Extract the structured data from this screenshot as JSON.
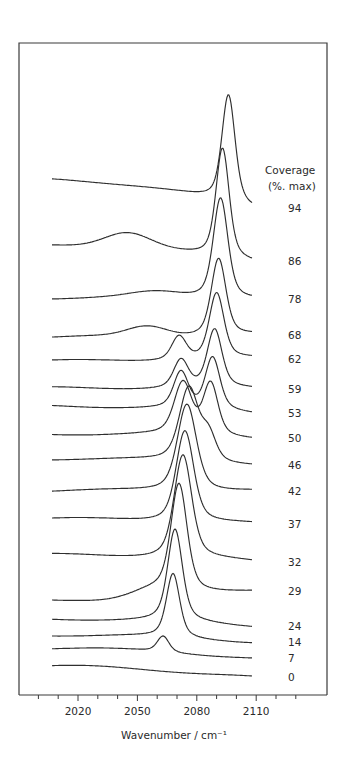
{
  "chart_data": {
    "type": "line",
    "title": "",
    "xlabel": "Wavenumber / cm⁻¹",
    "ylabel": "",
    "xlim": [
      2002,
      2118
    ],
    "x_ticks": [
      2020,
      2050,
      2080,
      2110
    ],
    "x_minor_step": 10,
    "grid": false,
    "legend": {
      "title_line1": "Coverage",
      "title_line2": "(%. max)",
      "position": "right"
    },
    "style": "stacked offset spectra (waterfall), highest coverage at top",
    "series": [
      {
        "name": "94",
        "baseline_y": 179,
        "end_y": 208,
        "peaks": [
          {
            "wn": 2096,
            "height": 108,
            "width": 4.5
          }
        ],
        "hump": null
      },
      {
        "name": "86",
        "baseline_y": 244,
        "end_y": 261,
        "peaks": [
          {
            "wn": 2093,
            "height": 110,
            "width": 4.5
          }
        ],
        "hump": {
          "wn": 2045,
          "height": 14,
          "width": 16
        }
      },
      {
        "name": "78",
        "baseline_y": 298,
        "end_y": 299,
        "peaks": [
          {
            "wn": 2092,
            "height": 102,
            "width": 5
          }
        ],
        "hump": {
          "wn": 2060,
          "height": 6,
          "width": 18
        }
      },
      {
        "name": "68",
        "baseline_y": 337,
        "end_y": 335,
        "peaks": [
          {
            "wn": 2091,
            "height": 78,
            "width": 5
          }
        ],
        "hump": {
          "wn": 2055,
          "height": 10,
          "width": 14
        }
      },
      {
        "name": "62",
        "baseline_y": 361,
        "end_y": 359,
        "peaks": [
          {
            "wn": 2090,
            "height": 66,
            "width": 5
          },
          {
            "wn": 2071,
            "height": 24,
            "width": 5
          }
        ],
        "hump": null
      },
      {
        "name": "59",
        "baseline_y": 388,
        "end_y": 389,
        "peaks": [
          {
            "wn": 2089,
            "height": 58,
            "width": 5
          },
          {
            "wn": 2072,
            "height": 28,
            "width": 5
          }
        ],
        "hump": null
      },
      {
        "name": "53",
        "baseline_y": 406,
        "end_y": 413,
        "peaks": [
          {
            "wn": 2088,
            "height": 52,
            "width": 5
          },
          {
            "wn": 2072,
            "height": 36,
            "width": 5
          }
        ],
        "hump": null
      },
      {
        "name": "50",
        "baseline_y": 434,
        "end_y": 438,
        "peaks": [
          {
            "wn": 2087,
            "height": 52,
            "width": 5
          },
          {
            "wn": 2073,
            "height": 52,
            "width": 6
          }
        ],
        "hump": null
      },
      {
        "name": "46",
        "baseline_y": 459,
        "end_y": 465,
        "peaks": [
          {
            "wn": 2076,
            "height": 74,
            "width": 6.5
          },
          {
            "wn": 2086,
            "height": 26,
            "width": 5
          }
        ],
        "hump": null
      },
      {
        "name": "42",
        "baseline_y": 491,
        "end_y": 491,
        "peaks": [
          {
            "wn": 2075,
            "height": 88,
            "width": 6.5
          }
        ],
        "hump": null
      },
      {
        "name": "37",
        "baseline_y": 519,
        "end_y": 524,
        "peaks": [
          {
            "wn": 2074,
            "height": 92,
            "width": 6
          }
        ],
        "hump": null
      },
      {
        "name": "32",
        "baseline_y": 555,
        "end_y": 562,
        "peaks": [
          {
            "wn": 2073,
            "height": 104,
            "width": 6
          }
        ],
        "hump": null
      },
      {
        "name": "29",
        "baseline_y": 601,
        "end_y": 591,
        "peaks": [
          {
            "wn": 2071,
            "height": 108,
            "width": 5.5
          }
        ],
        "hump": {
          "wn": 2058,
          "height": 8,
          "width": 16
        }
      },
      {
        "name": "24",
        "baseline_y": 619,
        "end_y": 626,
        "peaks": [
          {
            "wn": 2069,
            "height": 92,
            "width": 5
          }
        ],
        "hump": null
      },
      {
        "name": "14",
        "baseline_y": 635,
        "end_y": 642,
        "peaks": [
          {
            "wn": 2068,
            "height": 64,
            "width": 4.5
          }
        ],
        "hump": null
      },
      {
        "name": "7",
        "baseline_y": 648,
        "end_y": 658,
        "peaks": [
          {
            "wn": 2063,
            "height": 16,
            "width": 4
          }
        ],
        "hump": null
      },
      {
        "name": "0",
        "baseline_y": 666,
        "end_y": 677,
        "peaks": [],
        "hump": null
      }
    ],
    "labels": {
      "x_tick_labels": [
        "2020",
        "2050",
        "2080",
        "2110"
      ]
    }
  },
  "legend_labels": [
    "94",
    "86",
    "78",
    "68",
    "62",
    "59",
    "53",
    "50",
    "46",
    "42",
    "37",
    "32",
    "29",
    "24",
    "14",
    "7",
    "0"
  ]
}
